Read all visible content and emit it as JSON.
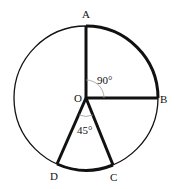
{
  "diagram": {
    "type": "circle-geometry",
    "center": {
      "label": "O",
      "x": 86,
      "y": 98
    },
    "radius": 72,
    "points": [
      {
        "label": "A",
        "x": 86,
        "y": 26,
        "lx": 82,
        "ly": 18
      },
      {
        "label": "B",
        "x": 158,
        "y": 98,
        "lx": 160,
        "ly": 103
      },
      {
        "label": "C",
        "x": 112,
        "y": 168,
        "lx": 110,
        "ly": 180
      },
      {
        "label": "D",
        "x": 57,
        "y": 167,
        "lx": 50,
        "ly": 178
      }
    ],
    "angles": [
      {
        "label": "90°",
        "between": [
          "A",
          "B"
        ],
        "lx": 97,
        "ly": 83
      },
      {
        "label": "45°",
        "between": [
          "D",
          "C"
        ],
        "lx": 77,
        "ly": 133
      }
    ],
    "center_label": {
      "text": "O",
      "lx": 74,
      "ly": 102
    }
  }
}
